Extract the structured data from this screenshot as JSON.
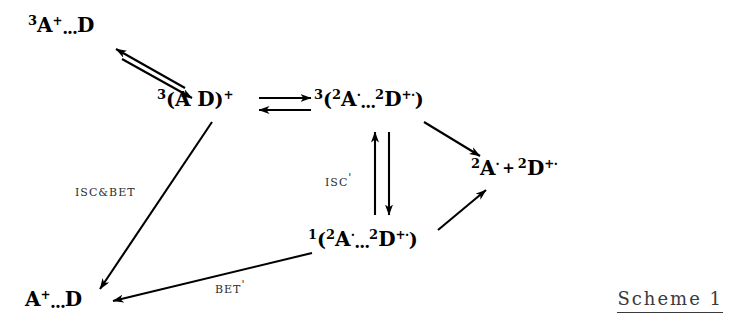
{
  "figure": {
    "type": "reaction-scheme",
    "caption": "Scheme 1",
    "background_color": "#ffffff",
    "ink_color": "#000000"
  },
  "species": {
    "triplet_ion_pair_top": {
      "multiplicity": "3",
      "left_atom": "A",
      "left_charge": "+",
      "separator": "...",
      "right_atom": "D",
      "plain_text": "3A+...D"
    },
    "triplet_contact_pair": {
      "multiplicity": "3",
      "open": "(",
      "left_atom": "A",
      "gap": " ",
      "right_atom": "D",
      "close": ")",
      "charge": "+",
      "plain_text": "3(A D)+"
    },
    "triplet_radical_pair": {
      "multiplicity": "3",
      "open": "(",
      "left_mult": "2",
      "left_atom": "A",
      "left_charge": "·",
      "separator": "...",
      "right_mult": "2",
      "right_atom": "D",
      "right_charge": "+·",
      "close": ")",
      "plain_text": "3(2A·...2D+·)"
    },
    "singlet_radical_pair": {
      "multiplicity": "1",
      "open": "(",
      "left_mult": "2",
      "left_atom": "A",
      "left_charge": "·",
      "separator": "...",
      "right_mult": "2",
      "right_atom": "D",
      "right_charge": "+·",
      "close": ")",
      "plain_text": "1(2A·...2D+·)"
    },
    "free_ions": {
      "left_mult": "2",
      "left_atom": "A",
      "left_charge": "·",
      "operator": "+",
      "right_mult": "2",
      "right_atom": "D",
      "right_charge": "+·",
      "plain_text": "2A· + 2D+·"
    },
    "ion_pair_bottom": {
      "left_atom": "A",
      "left_charge": "+",
      "separator": "...",
      "right_atom": "D",
      "plain_text": "A+...D"
    }
  },
  "reaction_labels": {
    "isc_bet": {
      "text": "ISC&BET",
      "prime": ""
    },
    "isc_prime": {
      "text": "ISC",
      "prime": "'"
    },
    "bet_prime": {
      "text": "BET",
      "prime": "'"
    }
  },
  "arrows": [
    {
      "name": "top-diagonal-equilibrium",
      "kind": "double-opposed",
      "from": "triplet_contact_pair",
      "to": "triplet_ion_pair_top"
    },
    {
      "name": "horizontal-equilibrium",
      "kind": "double-opposed",
      "from": "triplet_contact_pair",
      "to": "triplet_radical_pair"
    },
    {
      "name": "vertical-isc-equilibrium",
      "kind": "double-opposed",
      "from": "triplet_radical_pair",
      "to": "singlet_radical_pair",
      "label": "isc_prime"
    },
    {
      "name": "triplet-pair-to-free-ions",
      "kind": "single",
      "from": "triplet_radical_pair",
      "to": "free_ions"
    },
    {
      "name": "singlet-pair-to-free-ions",
      "kind": "single",
      "from": "singlet_radical_pair",
      "to": "free_ions"
    },
    {
      "name": "isc-bet-decay",
      "kind": "single",
      "from": "triplet_contact_pair",
      "to": "ion_pair_bottom",
      "label": "isc_bet"
    },
    {
      "name": "bet-prime-decay",
      "kind": "single",
      "from": "singlet_radical_pair",
      "to": "ion_pair_bottom",
      "label": "bet_prime"
    }
  ]
}
